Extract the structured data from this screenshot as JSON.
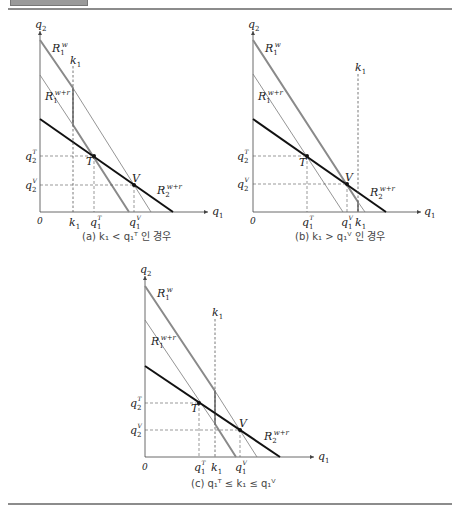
{
  "header": {
    "tab": ""
  },
  "panels": [
    {
      "id": "a",
      "caption": "(a) k₁ < q₁ᵀ 인 경우",
      "labels": {
        "q2_axis": "q",
        "q2_sub": "2",
        "q1_axis": "q",
        "q1_sub": "1",
        "origin": "0",
        "R1w": "R",
        "R1w_sub": "1",
        "R1w_sup": "w",
        "R1wr": "R",
        "R1wr_sub": "1",
        "R1wr_sup": "w+r",
        "R2wr": "R",
        "R2wr_sub": "2",
        "R2wr_sup": "w+r",
        "k1_top": "k",
        "k1_top_sub": "1",
        "k1_axis": "k",
        "k1_axis_sub": "1",
        "q1T": "q",
        "q1T_sub": "1",
        "q1T_sup": "T",
        "q1V": "q",
        "q1V_sub": "1",
        "q1V_sup": "V",
        "q2T": "q",
        "q2T_sub": "2",
        "q2T_sup": "T",
        "q2V": "q",
        "q2V_sub": "2",
        "q2V_sup": "V",
        "T": "T",
        "V": "V"
      }
    },
    {
      "id": "b",
      "caption": "(b) k₁ > q₁ⱽ 인 경우",
      "labels": {
        "q2_axis": "q",
        "q2_sub": "2",
        "q1_axis": "q",
        "q1_sub": "1",
        "origin": "0",
        "R1w": "R",
        "R1w_sub": "1",
        "R1w_sup": "w",
        "R1wr": "R",
        "R1wr_sub": "1",
        "R1wr_sup": "w+r",
        "R2wr": "R",
        "R2wr_sub": "2",
        "R2wr_sup": "w+r",
        "k1_top": "k",
        "k1_top_sub": "1",
        "k1_axis": "k",
        "k1_axis_sub": "1",
        "q1T": "q",
        "q1T_sub": "1",
        "q1T_sup": "T",
        "q1V": "q",
        "q1V_sub": "1",
        "q1V_sup": "V",
        "q2T": "q",
        "q2T_sub": "2",
        "q2T_sup": "T",
        "q2V": "q",
        "q2V_sub": "2",
        "q2V_sup": "V",
        "T": "T",
        "V": "V"
      }
    },
    {
      "id": "c",
      "caption": "(c) q₁ᵀ ≤ k₁ ≤ q₁ⱽ",
      "labels": {
        "q2_axis": "q",
        "q2_sub": "2",
        "q1_axis": "q",
        "q1_sub": "1",
        "origin": "0",
        "R1w": "R",
        "R1w_sub": "1",
        "R1w_sup": "w",
        "R1wr": "R",
        "R1wr_sub": "1",
        "R1wr_sup": "w+r",
        "R2wr": "R",
        "R2wr_sub": "2",
        "R2wr_sup": "w+r",
        "k1_top": "k",
        "k1_top_sub": "1",
        "k1_axis": "k",
        "k1_axis_sub": "1",
        "q1T": "q",
        "q1T_sub": "1",
        "q1T_sup": "T",
        "q1V": "q",
        "q1V_sub": "1",
        "q1V_sup": "V",
        "q2T": "q",
        "q2T_sub": "2",
        "q2T_sup": "T",
        "q2V": "q",
        "q2V_sub": "2",
        "q2V_sup": "V",
        "T": "T",
        "V": "V"
      }
    }
  ],
  "colors": {
    "axis": "#444444",
    "reaction_gray_thick": "#8a8a8a",
    "reaction_gray_thin": "#7a7a7a",
    "reaction_black": "#111111",
    "dashed": "#555555"
  }
}
